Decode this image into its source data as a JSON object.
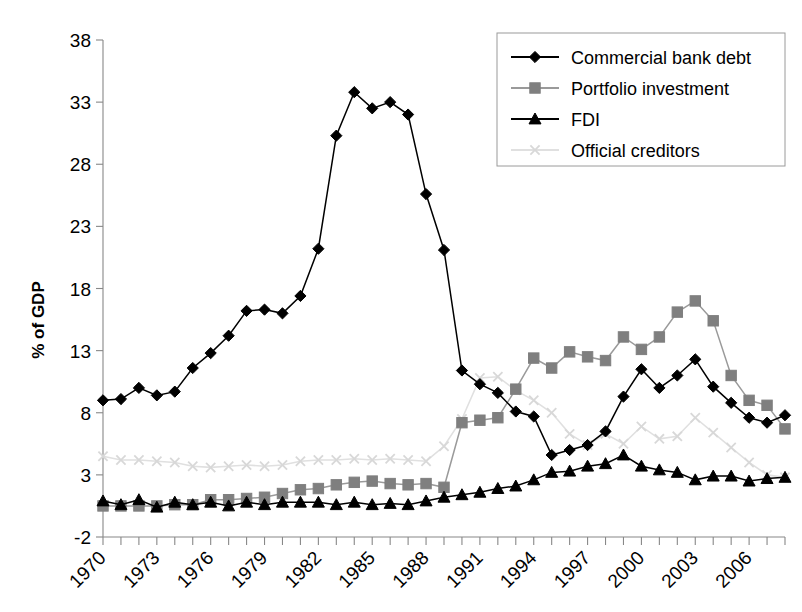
{
  "chart_data": {
    "type": "line",
    "title": "",
    "xlabel": "",
    "ylabel": "% of GDP",
    "ylim": [
      -2,
      38
    ],
    "xlim": [
      1970,
      2008
    ],
    "yticks": [
      -2,
      3,
      8,
      13,
      18,
      23,
      28,
      33,
      38
    ],
    "ytick_labels": [
      "-2",
      "3",
      "8",
      "13",
      "18",
      "23",
      "28",
      "33",
      "38"
    ],
    "xticks": [
      1970,
      1973,
      1976,
      1979,
      1982,
      1985,
      1988,
      1991,
      1994,
      1997,
      2000,
      2003,
      2006
    ],
    "xtick_labels": [
      "1970",
      "1973",
      "1976",
      "1979",
      "1982",
      "1985",
      "1988",
      "1991",
      "1994",
      "1997",
      "2000",
      "2003",
      "2006"
    ],
    "x": [
      1970,
      1971,
      1972,
      1973,
      1974,
      1975,
      1976,
      1977,
      1978,
      1979,
      1980,
      1981,
      1982,
      1983,
      1984,
      1985,
      1986,
      1987,
      1988,
      1989,
      1990,
      1991,
      1992,
      1993,
      1994,
      1995,
      1996,
      1997,
      1998,
      1999,
      2000,
      2001,
      2002,
      2003,
      2004,
      2005,
      2006,
      2007,
      2008
    ],
    "grid": false,
    "legend_position": "top-right",
    "series": [
      {
        "name": "Commercial bank debt",
        "marker": "diamond",
        "color": "#000000",
        "line_color": "#000000",
        "values": [
          9.0,
          9.1,
          10.0,
          9.4,
          9.7,
          11.6,
          12.8,
          14.2,
          16.2,
          16.3,
          16.0,
          17.4,
          21.2,
          30.3,
          33.8,
          32.5,
          33.0,
          32.0,
          25.6,
          21.1,
          11.4,
          10.3,
          9.6,
          8.1,
          7.7,
          4.6,
          5.0,
          5.4,
          6.5,
          9.3,
          11.5,
          10.0,
          11.0,
          12.3,
          10.1,
          8.8,
          7.6,
          7.2,
          7.8
        ]
      },
      {
        "name": "Portfolio investment",
        "marker": "square",
        "color": "#7f7f7f",
        "line_color": "#9a9a9a",
        "values": [
          0.5,
          0.5,
          0.5,
          0.5,
          0.6,
          0.6,
          1.0,
          1.0,
          1.1,
          1.2,
          1.5,
          1.8,
          1.9,
          2.2,
          2.4,
          2.5,
          2.3,
          2.2,
          2.3,
          2.0,
          7.2,
          7.4,
          7.6,
          9.9,
          12.4,
          11.6,
          12.9,
          12.5,
          12.2,
          14.1,
          13.1,
          14.1,
          16.1,
          17.0,
          15.4,
          11.0,
          9.0,
          8.6,
          6.7
        ]
      },
      {
        "name": "FDI",
        "marker": "triangle",
        "color": "#000000",
        "line_color": "#000000",
        "values": [
          0.9,
          0.6,
          1.0,
          0.4,
          0.8,
          0.6,
          0.8,
          0.5,
          0.8,
          0.6,
          0.8,
          0.8,
          0.8,
          0.6,
          0.8,
          0.6,
          0.7,
          0.6,
          0.9,
          1.2,
          1.4,
          1.6,
          1.9,
          2.1,
          2.6,
          3.2,
          3.3,
          3.7,
          3.9,
          4.6,
          3.7,
          3.4,
          3.2,
          2.6,
          2.9,
          2.9,
          2.5,
          2.7,
          2.8
        ]
      },
      {
        "name": "Official creditors",
        "marker": "x",
        "color": "#d8d8d8",
        "line_color": "#e0e0e0",
        "values": [
          4.5,
          4.2,
          4.2,
          4.1,
          4.0,
          3.7,
          3.6,
          3.7,
          3.8,
          3.7,
          3.8,
          4.1,
          4.2,
          4.2,
          4.3,
          4.2,
          4.3,
          4.2,
          4.1,
          5.3,
          7.5,
          10.8,
          10.9,
          9.8,
          9.0,
          8.0,
          6.3,
          5.4,
          6.3,
          5.5,
          6.9,
          5.9,
          6.1,
          7.6,
          6.4,
          5.2,
          4.0,
          3.0,
          2.8
        ]
      }
    ]
  },
  "legend": {
    "items": [
      {
        "label": "Commercial bank debt"
      },
      {
        "label": "Portfolio investment"
      },
      {
        "label": "FDI"
      },
      {
        "label": "Official creditors"
      }
    ]
  }
}
